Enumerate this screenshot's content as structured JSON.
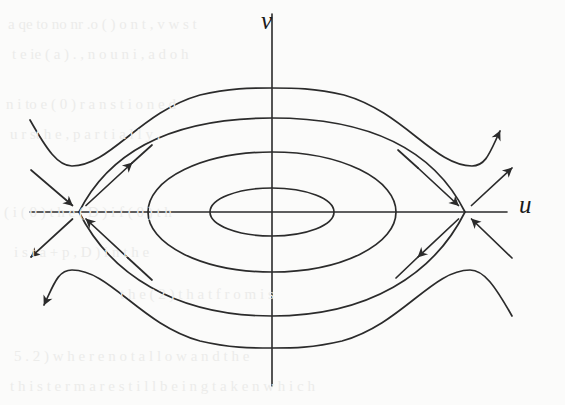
{
  "figure": {
    "kind": "phase-portrait",
    "axis_labels": {
      "horizontal": "u",
      "vertical": "v"
    },
    "background_color": "#fbfbfa",
    "stroke_color": "#2b2b2b"
  },
  "chart_data": {
    "type": "line",
    "title": "",
    "subtitle": "",
    "xlabel": "u",
    "ylabel": "v",
    "grid": false,
    "legend": null,
    "axes": {
      "origin_px": [
        272,
        212
      ],
      "x_axis_px": {
        "x1": 30,
        "y1": 212,
        "x2": 507,
        "y2": 212
      },
      "y_axis_px": {
        "x1": 272,
        "y1": 14,
        "x2": 272,
        "y2": 386
      }
    },
    "fixed_points": [
      {
        "name": "saddle-left",
        "type": "saddle",
        "px": [
          79,
          212
        ]
      },
      {
        "name": "saddle-right",
        "type": "saddle",
        "px": [
          465,
          212
        ]
      },
      {
        "name": "center-origin",
        "type": "center",
        "px": [
          272,
          212
        ]
      }
    ],
    "orbits": [
      {
        "name": "closed-orbit-inner",
        "type": "closed",
        "center_px": [
          272,
          212
        ],
        "semi_axis_x_px": 62,
        "semi_axis_y_px": 24
      },
      {
        "name": "closed-orbit-middle",
        "type": "closed",
        "center_px": [
          272,
          212
        ],
        "semi_axis_x_px": 124,
        "semi_axis_y_px": 60
      },
      {
        "name": "heteroclinic-separatrix",
        "type": "separatrix",
        "connects": [
          "saddle-left",
          "saddle-right"
        ],
        "top_px": [
          272,
          118
        ],
        "bottom_px": [
          272,
          316
        ]
      },
      {
        "name": "outer-orbit-upper",
        "type": "open",
        "top_px": [
          272,
          88
        ]
      },
      {
        "name": "outer-orbit-lower",
        "type": "open",
        "bottom_px": [
          272,
          345
        ]
      }
    ],
    "flow_arrows": [
      {
        "name": "arrow-stable-left-in",
        "at_px": [
          57,
          190
        ],
        "direction": "down-right",
        "meaning": "stable manifold inflow to left saddle"
      },
      {
        "name": "arrow-unstable-left-up",
        "at_px": [
          104,
          184
        ],
        "direction": "up-right",
        "meaning": "unstable manifold outflow from left saddle"
      },
      {
        "name": "arrow-stable-left-in2",
        "at_px": [
          100,
          240
        ],
        "direction": "up-left",
        "meaning": "stable manifold inflow to left saddle"
      },
      {
        "name": "arrow-unstable-left-down",
        "at_px": [
          50,
          240
        ],
        "direction": "down-left",
        "meaning": "unstable manifold outflow from left saddle"
      },
      {
        "name": "arrow-stable-right-in",
        "at_px": [
          444,
          188
        ],
        "direction": "down-right",
        "meaning": "stable manifold inflow to right saddle"
      },
      {
        "name": "arrow-unstable-right-up",
        "at_px": [
          492,
          182
        ],
        "direction": "up-right",
        "meaning": "unstable manifold outflow from right saddle"
      },
      {
        "name": "arrow-unstable-right-down",
        "at_px": [
          440,
          245
        ],
        "direction": "down-left",
        "meaning": "unstable manifold outflow from right saddle"
      },
      {
        "name": "arrow-outer-upper-right",
        "at_px": [
          505,
          124
        ],
        "direction": "up-right",
        "meaning": "outer upper trajectory outflow"
      },
      {
        "name": "arrow-outer-lower-left",
        "at_px": [
          33,
          302
        ],
        "direction": "down-left",
        "meaning": "outer lower trajectory outflow"
      }
    ]
  },
  "bleedthrough": {
    "lines": [
      {
        "text": "a  qe  to  no  nr  .o  (  )  o  n  t  ,   v  w  s  t",
        "left_px": 8,
        "top_px": 16
      },
      {
        "text": "t  e  ie  (  a  ) .  , n  o  u  n  i  ,  a  d  o  h",
        "left_px": 12,
        "top_px": 46
      },
      {
        "text": "n  i  to  e  (  0 )  r  a  n  s  t  i  o  n  e  d",
        "left_px": 6,
        "top_px": 96
      },
      {
        "text": "u  r  st  h  e  ,   p  a  r  t  i  a  l  l  y  .",
        "left_px": 10,
        "top_px": 126
      },
      {
        "text": "( i ( 0 )    t h e   ( D )    i f   ( 0 )   t h",
        "left_px": 4,
        "top_px": 204
      },
      {
        "text": "i s   t   a   +  p  ,  D )  i  n  t  h  e",
        "left_px": 14,
        "top_px": 244
      },
      {
        "text": "t h e   ( 2 )    t h a t   f r o m   i s",
        "left_px": 120,
        "top_px": 286
      },
      {
        "text": "5 . 2 )   w h e r e   n o t   a l l o w   a n d   t h e",
        "left_px": 14,
        "top_px": 348
      },
      {
        "text": "t h i s   t e r m   a r e   s t i l l   b e i n g   t a k e n   w h i c h",
        "left_px": 10,
        "top_px": 378
      }
    ]
  }
}
